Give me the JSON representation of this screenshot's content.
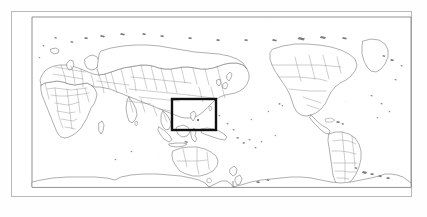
{
  "figure": {
    "projection": "equirectangular",
    "centre_longitude": 150,
    "background_color": "#ffffff",
    "frame_color": "#b9b9b9",
    "coastline_color": "#6e6e6e",
    "country_border_color": "#8a8a8a",
    "highlight_box_color": "#111111"
  },
  "outer_frame": {
    "label": "figure-border",
    "x": 11,
    "y": 11,
    "width": 401,
    "height": 186
  },
  "map_frame": {
    "label": "map-neatline",
    "x": 21,
    "y": 6,
    "width": 379,
    "height": 176
  },
  "study_area_box": {
    "label": "study-area",
    "region_name": "New Guinea / eastern Indonesia / Melanesia",
    "x": 161,
    "y": 88,
    "width": 44,
    "height": 31,
    "stroke_width": 2.4,
    "stroke_color": "#111111"
  },
  "landmasses": [
    {
      "name": "Europe"
    },
    {
      "name": "Africa"
    },
    {
      "name": "Asia"
    },
    {
      "name": "Australia"
    },
    {
      "name": "New Zealand"
    },
    {
      "name": "North America"
    },
    {
      "name": "South America"
    },
    {
      "name": "Greenland"
    },
    {
      "name": "Antarctica"
    },
    {
      "name": "Indonesia"
    },
    {
      "name": "New Guinea"
    },
    {
      "name": "Japan"
    },
    {
      "name": "Philippines"
    },
    {
      "name": "Madagascar"
    },
    {
      "name": "Great Britain"
    },
    {
      "name": "Iceland"
    },
    {
      "name": "Sri Lanka"
    },
    {
      "name": "Cuba"
    },
    {
      "name": "Hawaii"
    },
    {
      "name": "Pacific islands"
    }
  ],
  "oceans": [
    {
      "name": "Pacific Ocean"
    },
    {
      "name": "Atlantic Ocean"
    },
    {
      "name": "Indian Ocean"
    },
    {
      "name": "Arctic Ocean"
    },
    {
      "name": "Southern Ocean"
    }
  ]
}
